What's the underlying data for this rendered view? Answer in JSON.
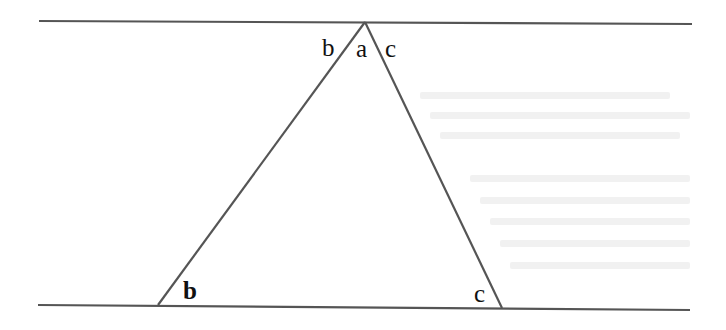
{
  "diagram": {
    "type": "parallel-lines-triangle",
    "colors": {
      "line": "#555555",
      "label": "#111111",
      "background": "#ffffff",
      "ghost_text": "#f1f1f1"
    },
    "top_line": {
      "x1": 39,
      "y1": 21,
      "x2": 692,
      "y2": 24
    },
    "bottom_line": {
      "x1": 38,
      "y1": 305,
      "x2": 690,
      "y2": 310
    },
    "triangle": {
      "apex": {
        "x": 365,
        "y": 22
      },
      "bottom_left": {
        "x": 158,
        "y": 305
      },
      "bottom_right": {
        "x": 502,
        "y": 308
      }
    },
    "labels": {
      "apex_left": {
        "text": "b",
        "x": 322,
        "y": 56
      },
      "apex_middle": {
        "text": "a",
        "x": 356,
        "y": 57
      },
      "apex_right": {
        "text": "c",
        "x": 385,
        "y": 57
      },
      "bottom_left_angle": {
        "text": "b",
        "x": 183,
        "y": 299
      },
      "bottom_right_angle": {
        "text": "c",
        "x": 474,
        "y": 302
      }
    }
  }
}
